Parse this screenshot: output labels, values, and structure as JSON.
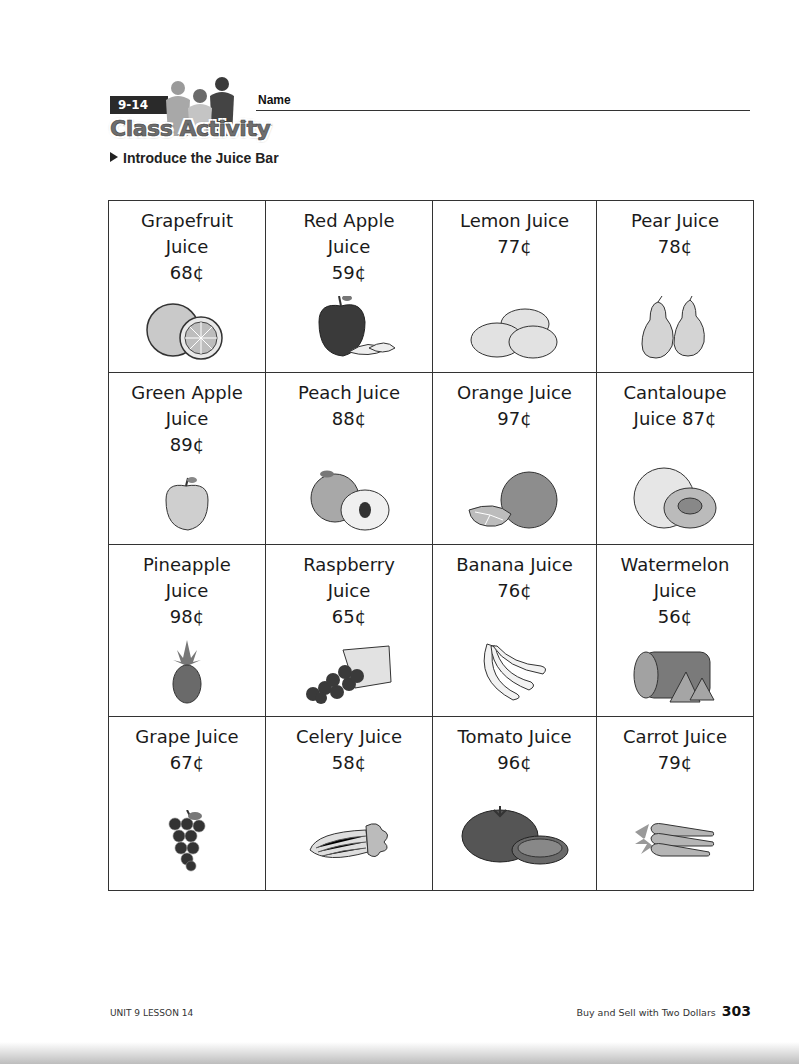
{
  "header": {
    "lesson_number": "9-14",
    "activity_title": "Class Activity",
    "name_label": "Name",
    "section_title": "Introduce the Juice Bar"
  },
  "juices": [
    {
      "name_line1": "Grapefruit",
      "name_line2": "Juice",
      "price": "68¢",
      "icon": "grapefruit-icon"
    },
    {
      "name_line1": "Red Apple",
      "name_line2": "Juice",
      "price": "59¢",
      "icon": "red-apple-icon"
    },
    {
      "name_line1": "Lemon Juice",
      "name_line2": "",
      "price": "77¢",
      "icon": "lemon-icon"
    },
    {
      "name_line1": "Pear Juice",
      "name_line2": "",
      "price": "78¢",
      "icon": "pear-icon"
    },
    {
      "name_line1": "Green Apple",
      "name_line2": "Juice",
      "price": "89¢",
      "icon": "green-apple-icon"
    },
    {
      "name_line1": "Peach Juice",
      "name_line2": "",
      "price": "88¢",
      "icon": "peach-icon"
    },
    {
      "name_line1": "Orange Juice",
      "name_line2": "",
      "price": "97¢",
      "icon": "orange-icon"
    },
    {
      "name_line1": "Cantaloupe",
      "name_line2": "Juice 87¢",
      "price": "",
      "icon": "cantaloupe-icon"
    },
    {
      "name_line1": "Pineapple",
      "name_line2": "Juice",
      "price": "98¢",
      "icon": "pineapple-icon"
    },
    {
      "name_line1": "Raspberry",
      "name_line2": "Juice",
      "price": "65¢",
      "icon": "raspberry-icon"
    },
    {
      "name_line1": "Banana Juice",
      "name_line2": "",
      "price": "76¢",
      "icon": "banana-icon"
    },
    {
      "name_line1": "Watermelon",
      "name_line2": "Juice",
      "price": "56¢",
      "icon": "watermelon-icon"
    },
    {
      "name_line1": "Grape Juice",
      "name_line2": "",
      "price": "67¢",
      "icon": "grape-icon"
    },
    {
      "name_line1": "Celery Juice",
      "name_line2": "",
      "price": "58¢",
      "icon": "celery-icon"
    },
    {
      "name_line1": "Tomato Juice",
      "name_line2": "",
      "price": "96¢",
      "icon": "tomato-icon"
    },
    {
      "name_line1": "Carrot Juice",
      "name_line2": "",
      "price": "79¢",
      "icon": "carrot-icon"
    }
  ],
  "footer": {
    "unit_lesson": "UNIT 9 LESSON 14",
    "chapter_title": "Buy and Sell with Two Dollars",
    "page_number": "303"
  },
  "colors": {
    "ink": "#111111",
    "border": "#333333",
    "fruit_fill": "#bdbdbd",
    "fruit_dark": "#555555"
  }
}
